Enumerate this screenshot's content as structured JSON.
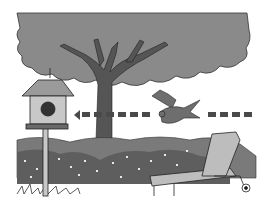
{
  "illustration": {
    "description": "Grayscale illustration: a bird flies from right to left toward a birdhouse on a pole, passing a tree; a lounge chair sits in front of a hedge of flowers",
    "colors": {
      "background": "#ffffff",
      "canopy": "#8a8a8a",
      "trunk": "#555555",
      "hedge": "#7a7a7a",
      "hedge_dark": "#5e5e5e",
      "birdhouse_roof": "#9a9a9a",
      "birdhouse_body": "#c8c8c8",
      "birdhouse_hole": "#333333",
      "bird": "#6e6e6e",
      "chair": "#bdbdbd",
      "arrow": "#4a4a4a",
      "outline": "#222222"
    },
    "elements": [
      "tree",
      "birdhouse",
      "bird",
      "dashed-arrow",
      "hedge",
      "lounge-chair",
      "grass"
    ]
  }
}
